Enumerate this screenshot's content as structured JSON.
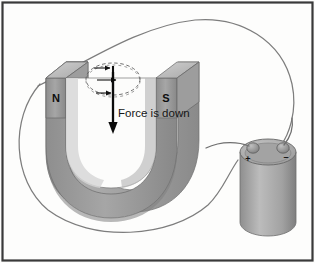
{
  "figure": {
    "background_color": "#fdfdfc",
    "frame_color": "#3a3a3a"
  },
  "magnet": {
    "type": "u-shaped-horseshoe-magnet",
    "north_pole_label": "N",
    "south_pole_label": "S",
    "body_color": "#9a9a9a",
    "top_face_color": "#c3c3c3",
    "shadow_color": "#6e6e6e"
  },
  "force": {
    "caption": "Force is down",
    "arrow_direction": "down",
    "arrow_color": "#0a0a0a"
  },
  "field": {
    "arrow_count": 3,
    "arrow_direction": "right",
    "ellipse_style": "dashed",
    "ellipse_color": "#5a5a5a"
  },
  "battery": {
    "positive_terminal_label": "+",
    "negative_terminal_label": "–",
    "body_color": "#a8a8a8",
    "top_color": "#b5b5b5"
  },
  "wire": {
    "color": "#7a7a7a",
    "description": "circuit-loop-wire"
  }
}
